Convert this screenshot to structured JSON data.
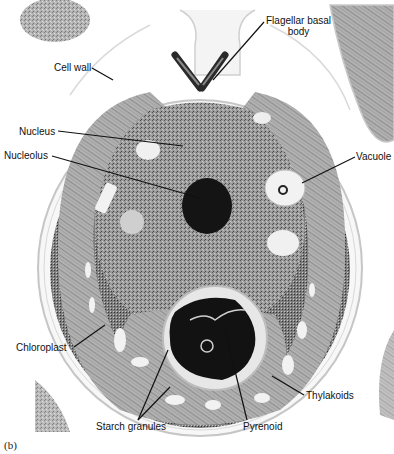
{
  "figure": {
    "panel_label": "(b)",
    "labels": {
      "flagellar_basal_body_line1": "Flagellar basal",
      "flagellar_basal_body_line2": "body",
      "cell_wall": "Cell wall",
      "nucleus": "Nucleus",
      "nucleolus": "Nucleolus",
      "vacuole": "Vacuole",
      "chloroplast": "Chloroplast",
      "thylakoids": "Thylakoids",
      "starch_granules": "Starch granules",
      "pyrenoid": "Pyrenoid"
    },
    "colors": {
      "background": "#ffffff",
      "cytoplasm": "#8a8a8a",
      "chloroplast": "#a9a9a9",
      "nucleolus": "#111111",
      "pyrenoid": "#151515",
      "wall": "#d2d2d2",
      "leader_line": "#111111"
    }
  }
}
